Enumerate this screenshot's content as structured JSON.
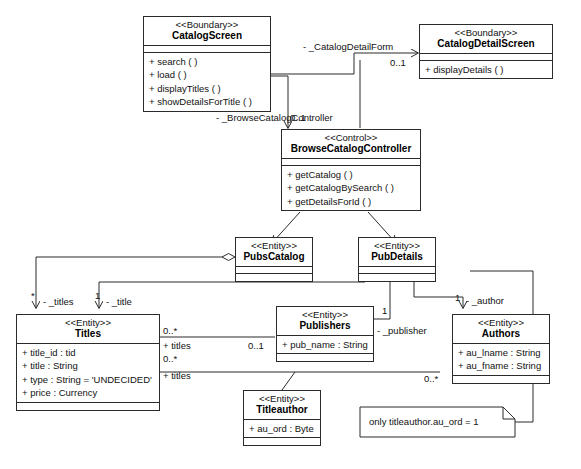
{
  "diagram": {
    "line_color": "#2b2b2b",
    "fill_color": "#ffffff"
  },
  "classes": [
    {
      "id": "catalog-screen",
      "stereotype": "<<Boundary>>",
      "name": "CatalogScreen",
      "attributes": [],
      "operations": [
        "+ search (  )",
        "+ load (  )",
        "+ displayTitles (  )",
        "+ showDetailsForTitle (  )"
      ]
    },
    {
      "id": "catalog-detail-screen",
      "stereotype": "<<Boundary>>",
      "name": "CatalogDetailScreen",
      "attributes": [],
      "operations": [
        "+ displayDetails (  )"
      ]
    },
    {
      "id": "browse-catalog-controller",
      "stereotype": "<<Control>>",
      "name": "BrowseCatalogController",
      "attributes": [],
      "operations": [
        "+ getCatalog (  )",
        "+ getCatalogBySearch (  )",
        "+ getDetailsForId (  )"
      ]
    },
    {
      "id": "pubs-catalog",
      "stereotype": "<<Entity>>",
      "name": "PubsCatalog",
      "attributes": [],
      "operations": []
    },
    {
      "id": "pub-details",
      "stereotype": "<<Entity>>",
      "name": "PubDetails",
      "attributes": [],
      "operations": []
    },
    {
      "id": "titles",
      "stereotype": "<<Entity>>",
      "name": "Titles",
      "attributes": [
        "+ title_id : tid",
        "+ title : String",
        "+ type : String = 'UNDECIDED'",
        "+ price : Currency"
      ],
      "operations": []
    },
    {
      "id": "publishers",
      "stereotype": "<<Entity>>",
      "name": "Publishers",
      "attributes": [
        "+ pub_name : String"
      ],
      "operations": []
    },
    {
      "id": "authors",
      "stereotype": "<<Entity>>",
      "name": "Authors",
      "attributes": [
        "+ au_lname : String",
        "+ au_fname : String"
      ],
      "operations": []
    },
    {
      "id": "titleauthor",
      "stereotype": "<<Entity>>",
      "name": "Titleauthor",
      "attributes": [
        "+ au_ord : Byte"
      ],
      "operations": []
    }
  ],
  "edge_labels": [
    {
      "id": "catalog-detail-form-role",
      "text": "-  _CatalogDetailForm"
    },
    {
      "id": "catalog-detail-form-mult",
      "text": "0..1"
    },
    {
      "id": "browse-catalog-controller-role",
      "text": "-  _BrowseCatalogController"
    },
    {
      "id": "browse-catalog-controller-mult",
      "text": "0..1"
    },
    {
      "id": "titles-star-mult",
      "text": "*"
    },
    {
      "id": "titles-role",
      "text": "-  _titles"
    },
    {
      "id": "title-one-mult",
      "text": "1"
    },
    {
      "id": "title-role",
      "text": "-  _title"
    },
    {
      "id": "titles-assoc-mult-top",
      "text": "0..*"
    },
    {
      "id": "titles-assoc-role-top",
      "text": "+ titles"
    },
    {
      "id": "publishers-mult",
      "text": "0..1"
    },
    {
      "id": "titles-assoc-mult-bottom",
      "text": "0..*"
    },
    {
      "id": "titles-assoc-role-bottom",
      "text": "+ titles"
    },
    {
      "id": "publisher-one-mult",
      "text": "1"
    },
    {
      "id": "publisher-role",
      "text": "-  _publisher"
    },
    {
      "id": "author-one-mult",
      "text": "1"
    },
    {
      "id": "author-role",
      "text": "-  _author"
    },
    {
      "id": "authors-many-mult",
      "text": "0..*"
    }
  ],
  "note": {
    "id": "constraint-note",
    "text": "only titleauthor.au_ord = 1"
  }
}
